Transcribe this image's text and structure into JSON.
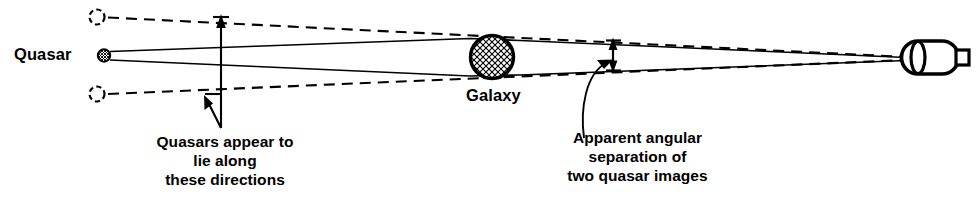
{
  "figure": {
    "type": "optics-ray-diagram",
    "topic": "gravitational-lensing-of-a-quasar-by-a-galaxy",
    "background_color": "#ffffff",
    "ink_color": "#000000"
  },
  "labels": {
    "quasar": "Quasar",
    "galaxy": "Galaxy",
    "caption_left": "Quasars appear to\nlie along\nthese directions",
    "caption_right": "Apparent angular\nseparation of\ntwo quasar images"
  },
  "caption_left_lines": [
    "Quasars appear to",
    "lie along",
    "these directions"
  ],
  "caption_right_lines": [
    "Apparent angular",
    "separation of",
    "two quasar images"
  ],
  "objects": {
    "quasar_source": {
      "name": "quasar-source-marker",
      "shape": "hatched-circle",
      "cx": 104,
      "cy": 55,
      "r": 6
    },
    "galaxy": {
      "name": "galaxy-lens",
      "shape": "hatched-circle",
      "cx": 492,
      "cy": 57,
      "r": 22
    },
    "telescope": {
      "name": "observer-telescope",
      "shape": "capsule-with-eyepiece",
      "x": 908,
      "y": 40,
      "width": 48,
      "height": 34
    },
    "apparent_image_upper": {
      "name": "apparent-quasar-image-upper",
      "shape": "dashed-circle",
      "cx": 97,
      "cy": 17,
      "r": 8
    },
    "apparent_image_lower": {
      "name": "apparent-quasar-image-lower",
      "shape": "dashed-circle",
      "cx": 97,
      "cy": 94,
      "r": 8
    }
  },
  "rays": {
    "solid_upper": {
      "from": [
        110,
        52
      ],
      "to": [
        906,
        58
      ],
      "style": "solid",
      "note": "light path bent above the galaxy"
    },
    "solid_lower": {
      "from": [
        110,
        60
      ],
      "to": [
        906,
        60
      ],
      "style": "solid",
      "note": "light path bent below the galaxy"
    },
    "dashed_upper": {
      "from": [
        108,
        17
      ],
      "to": [
        906,
        57
      ],
      "style": "dashed",
      "note": "apparent line of sight to upper image"
    },
    "dashed_lower": {
      "from": [
        108,
        94
      ],
      "to": [
        906,
        60
      ],
      "style": "dashed",
      "note": "apparent line of sight to lower image"
    }
  },
  "annotations": {
    "direction_pointer": {
      "name": "direction-pointer-arrow",
      "x": 221,
      "top_y": 16,
      "bottom_y": 142,
      "heads": "both-ends-upper-and-lower-dashed-lines"
    },
    "separation_arrow": {
      "name": "angular-separation-arrow",
      "x": 613,
      "top_y": 41,
      "bottom_y": 69,
      "heads": "double"
    },
    "separation_leader": {
      "name": "separation-leader-curve",
      "from": [
        584,
        136
      ],
      "to": [
        611,
        58
      ],
      "arrowhead": "end"
    }
  }
}
